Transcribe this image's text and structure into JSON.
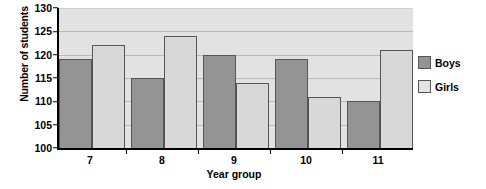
{
  "chart_data": {
    "type": "bar",
    "title": "",
    "xlabel": "Year group",
    "ylabel": "Number of students",
    "categories": [
      "7",
      "8",
      "9",
      "10",
      "11"
    ],
    "series": [
      {
        "name": "Boys",
        "values": [
          119,
          115,
          120,
          119,
          110
        ],
        "color": "#949494"
      },
      {
        "name": "Girls",
        "values": [
          122,
          124,
          114,
          111,
          121
        ],
        "color": "#d8d8d8"
      }
    ],
    "ylim": [
      100,
      130
    ],
    "yticks": [
      100,
      105,
      110,
      115,
      120,
      125,
      130
    ],
    "grid": true,
    "legend_position": "right",
    "plot_background": "#e2e2e2"
  }
}
